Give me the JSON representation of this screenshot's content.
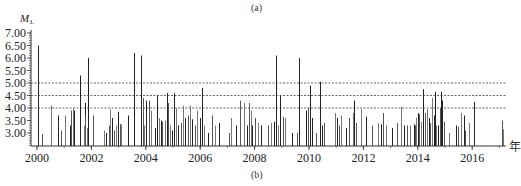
{
  "panel_top_label": "(a)",
  "panel_bottom_label": "(b)",
  "chart_data": {
    "type": "bar",
    "title": "",
    "ylabel": "M_L",
    "ylabel_main": "M",
    "ylabel_sub": "L",
    "xlabel": "年",
    "ylim": [
      2.5,
      7.1
    ],
    "xlim": [
      1999.8,
      2017.4
    ],
    "y_ticks": [
      "7.00",
      "6.50",
      "6.00",
      "5.50",
      "5.00",
      "4.50",
      "4.00",
      "3.50",
      "3.00"
    ],
    "y_tick_values": [
      7.0,
      6.5,
      6.0,
      5.5,
      5.0,
      4.5,
      4.0,
      3.5,
      3.0
    ],
    "x_ticks": [
      "2000",
      "2002",
      "2004",
      "2006",
      "2008",
      "2010",
      "2012",
      "2014",
      "2016"
    ],
    "x_tick_values": [
      2000,
      2002,
      2004,
      2006,
      2008,
      2010,
      2012,
      2014,
      2016
    ],
    "reference_lines": [
      {
        "value": 5.0,
        "style": "dashed"
      },
      {
        "value": 4.5,
        "style": "dashed"
      },
      {
        "value": 4.0,
        "style": "dashed"
      }
    ],
    "grid": false,
    "legend": null,
    "series": [
      {
        "name": "earthquake magnitude",
        "points": [
          [
            2000.02,
            6.5
          ],
          [
            2000.18,
            2.95
          ],
          [
            2000.5,
            4.1
          ],
          [
            2000.78,
            3.7
          ],
          [
            2000.88,
            3.1
          ],
          [
            2001.02,
            3.7
          ],
          [
            2001.2,
            3.3
          ],
          [
            2001.25,
            3.9
          ],
          [
            2001.32,
            4.0
          ],
          [
            2001.35,
            3.9
          ],
          [
            2001.58,
            5.3
          ],
          [
            2001.72,
            3.3
          ],
          [
            2001.75,
            4.2
          ],
          [
            2001.78,
            3.7
          ],
          [
            2001.82,
            3.2
          ],
          [
            2001.88,
            6.0
          ],
          [
            2002.05,
            3.7
          ],
          [
            2002.45,
            3.1
          ],
          [
            2002.55,
            3.0
          ],
          [
            2002.65,
            3.3
          ],
          [
            2002.7,
            3.95
          ],
          [
            2002.75,
            3.6
          ],
          [
            2002.82,
            3.1
          ],
          [
            2002.92,
            3.3
          ],
          [
            2002.98,
            3.85
          ],
          [
            2003.05,
            3.35
          ],
          [
            2003.1,
            3.35
          ],
          [
            2003.35,
            3.7
          ],
          [
            2003.55,
            3.8
          ],
          [
            2003.58,
            6.2
          ],
          [
            2003.82,
            6.1
          ],
          [
            2003.88,
            4.4
          ],
          [
            2003.92,
            3.3
          ],
          [
            2004.0,
            4.3
          ],
          [
            2004.12,
            4.3
          ],
          [
            2004.2,
            3.9
          ],
          [
            2004.35,
            3.2
          ],
          [
            2004.42,
            4.5
          ],
          [
            2004.48,
            3.6
          ],
          [
            2004.55,
            3.5
          ],
          [
            2004.6,
            3.45
          ],
          [
            2004.7,
            3.5
          ],
          [
            2004.78,
            4.6
          ],
          [
            2004.82,
            4.2
          ],
          [
            2004.88,
            3.3
          ],
          [
            2004.95,
            3.1
          ],
          [
            2005.05,
            4.6
          ],
          [
            2005.1,
            4.0
          ],
          [
            2005.2,
            3.3
          ],
          [
            2005.28,
            3.4
          ],
          [
            2005.35,
            4.1
          ],
          [
            2005.45,
            3.6
          ],
          [
            2005.55,
            3.7
          ],
          [
            2005.62,
            4.1
          ],
          [
            2005.7,
            3.55
          ],
          [
            2005.8,
            3.3
          ],
          [
            2005.9,
            3.9
          ],
          [
            2006.0,
            3.6
          ],
          [
            2006.08,
            4.8
          ],
          [
            2006.15,
            3.3
          ],
          [
            2006.3,
            3.0
          ],
          [
            2006.45,
            3.7
          ],
          [
            2006.55,
            3.3
          ],
          [
            2006.7,
            3.4
          ],
          [
            2007.05,
            3.0
          ],
          [
            2007.15,
            3.6
          ],
          [
            2007.3,
            3.3
          ],
          [
            2007.45,
            4.3
          ],
          [
            2007.62,
            4.2
          ],
          [
            2007.72,
            3.3
          ],
          [
            2007.8,
            4.2
          ],
          [
            2007.85,
            3.9
          ],
          [
            2007.9,
            3.3
          ],
          [
            2008.0,
            3.6
          ],
          [
            2008.12,
            3.4
          ],
          [
            2008.25,
            3.3
          ],
          [
            2008.48,
            3.3
          ],
          [
            2008.6,
            3.4
          ],
          [
            2008.72,
            3.45
          ],
          [
            2008.78,
            6.1
          ],
          [
            2008.85,
            3.3
          ],
          [
            2008.95,
            4.5
          ],
          [
            2009.05,
            3.65
          ],
          [
            2009.1,
            3.6
          ],
          [
            2009.38,
            3.0
          ],
          [
            2009.55,
            3.0
          ],
          [
            2009.62,
            6.0
          ],
          [
            2009.9,
            3.9
          ],
          [
            2009.98,
            4.0
          ],
          [
            2010.05,
            4.9
          ],
          [
            2010.1,
            3.6
          ],
          [
            2010.25,
            3.0
          ],
          [
            2010.4,
            5.05
          ],
          [
            2010.48,
            3.3
          ],
          [
            2010.55,
            3.4
          ],
          [
            2010.95,
            3.8
          ],
          [
            2011.02,
            3.6
          ],
          [
            2011.1,
            3.3
          ],
          [
            2011.18,
            3.7
          ],
          [
            2011.35,
            3.2
          ],
          [
            2011.48,
            3.6
          ],
          [
            2011.6,
            3.8
          ],
          [
            2011.65,
            4.3
          ],
          [
            2011.72,
            3.4
          ],
          [
            2011.9,
            3.95
          ],
          [
            2012.1,
            3.65
          ],
          [
            2012.3,
            3.3
          ],
          [
            2012.55,
            3.4
          ],
          [
            2012.65,
            3.35
          ],
          [
            2012.72,
            3.8
          ],
          [
            2012.82,
            3.3
          ],
          [
            2013.05,
            3.2
          ],
          [
            2013.25,
            3.4
          ],
          [
            2013.4,
            4.05
          ],
          [
            2013.5,
            3.3
          ],
          [
            2013.6,
            3.3
          ],
          [
            2013.72,
            3.3
          ],
          [
            2013.85,
            3.35
          ],
          [
            2013.9,
            3.3
          ],
          [
            2013.95,
            3.6
          ],
          [
            2014.0,
            3.8
          ],
          [
            2014.05,
            3.75
          ],
          [
            2014.12,
            3.45
          ],
          [
            2014.2,
            4.75
          ],
          [
            2014.28,
            3.8
          ],
          [
            2014.35,
            3.95
          ],
          [
            2014.4,
            3.6
          ],
          [
            2014.45,
            3.4
          ],
          [
            2014.52,
            4.4
          ],
          [
            2014.58,
            3.7
          ],
          [
            2014.62,
            4.65
          ],
          [
            2014.68,
            3.3
          ],
          [
            2014.75,
            3.3
          ],
          [
            2014.82,
            4.0
          ],
          [
            2014.85,
            4.65
          ],
          [
            2014.9,
            4.3
          ],
          [
            2014.95,
            3.45
          ],
          [
            2015.15,
            3.0
          ],
          [
            2015.42,
            3.3
          ],
          [
            2015.48,
            3.25
          ],
          [
            2015.58,
            3.8
          ],
          [
            2015.7,
            3.7
          ],
          [
            2015.75,
            3.1
          ],
          [
            2015.88,
            3.4
          ],
          [
            2016.05,
            4.25
          ],
          [
            2017.1,
            3.5
          ],
          [
            2017.15,
            3.15
          ]
        ]
      }
    ]
  }
}
